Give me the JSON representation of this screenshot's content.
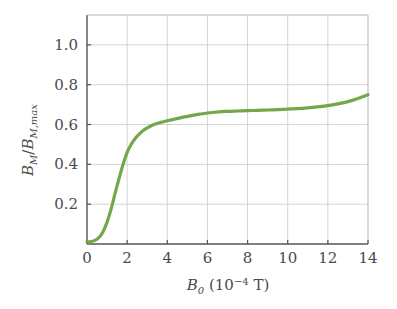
{
  "chart_data": {
    "type": "line",
    "title": "",
    "xlabel": "B_0 (10^-4 T)",
    "ylabel": "B_M/B_M,max",
    "xlabel_parts": {
      "symbol": "B",
      "symbol_sub": "0",
      "unit_open": " (10",
      "unit_exp": "−4",
      "unit_close": " T)"
    },
    "ylabel_parts": {
      "num_symbol": "B",
      "num_sub": "M",
      "slash": "/",
      "den_symbol": "B",
      "den_sub": "M,max"
    },
    "xlim": [
      0,
      14
    ],
    "ylim": [
      0,
      1.15
    ],
    "xticks": [
      0,
      2,
      4,
      6,
      8,
      10,
      12,
      14
    ],
    "xtick_labels": [
      "0",
      "2",
      "4",
      "6",
      "8",
      "10",
      "12",
      "14"
    ],
    "yticks": [
      0.2,
      0.4,
      0.6,
      0.8,
      1.0
    ],
    "ytick_labels": [
      "0.2",
      "0.4",
      "0.6",
      "0.8",
      "1.0"
    ],
    "grid": true,
    "grid_color": "#c9c9c9",
    "legend": null,
    "series": [
      {
        "name": "magnetization",
        "color": "#72a84a",
        "linewidth": 3.2,
        "x": [
          0.0,
          0.2,
          0.4,
          0.6,
          0.8,
          1.0,
          1.2,
          1.4,
          1.6,
          1.8,
          2.0,
          2.2,
          2.4,
          2.6,
          2.8,
          3.0,
          3.2,
          3.4,
          3.6,
          3.8,
          4.0,
          4.4,
          4.8,
          5.2,
          5.6,
          6.0,
          6.5,
          7.0,
          7.5,
          8.0,
          8.5,
          9.0,
          9.5,
          10.0,
          10.5,
          11.0,
          11.5,
          12.0,
          12.5,
          13.0,
          13.5,
          14.0
        ],
        "y": [
          0.01,
          0.012,
          0.018,
          0.033,
          0.062,
          0.11,
          0.175,
          0.255,
          0.33,
          0.4,
          0.46,
          0.5,
          0.53,
          0.552,
          0.57,
          0.583,
          0.594,
          0.602,
          0.609,
          0.614,
          0.619,
          0.628,
          0.637,
          0.645,
          0.652,
          0.658,
          0.663,
          0.666,
          0.668,
          0.67,
          0.671,
          0.673,
          0.675,
          0.677,
          0.68,
          0.684,
          0.689,
          0.695,
          0.704,
          0.715,
          0.731,
          0.75
        ]
      }
    ],
    "axis_colors": {
      "frame": "#555555",
      "tick_text": "#4a4a4a",
      "background": "#ffffff"
    }
  }
}
